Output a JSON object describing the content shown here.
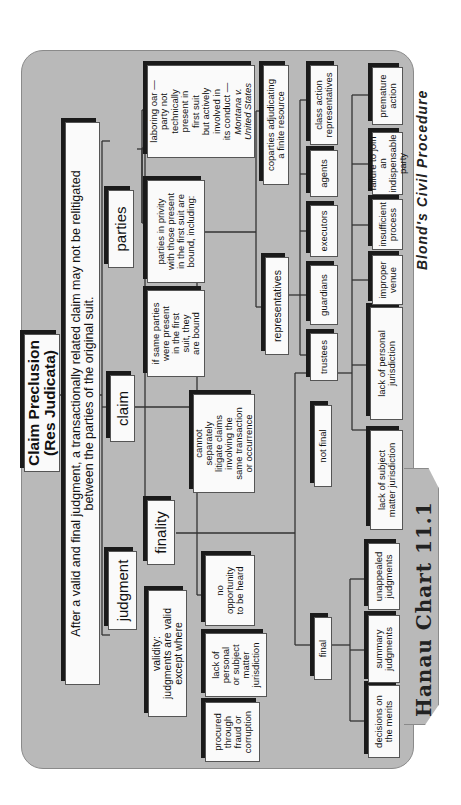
{
  "chart_title": "Claim Preclusion (Res Judicata)",
  "title_lines": "Claim Preclusion\n(Res Judicata)",
  "statement": "After a valid and final judgment, a transactionally related claim may not be relitigated\nbetween the parties of the original suit.",
  "branches": {
    "judgment": {
      "label": "judgment",
      "validity": {
        "label": "validity:\njudgments are valid\nexcept where",
        "exceptions": [
          "procured\nthrough\nfraud or\ncorruption",
          "lack of\npersonal\nor subject\nmatter\njurisdiction",
          "no\nopportunity\nto be heard"
        ]
      },
      "finality": {
        "label": "finality",
        "final": {
          "label": "final",
          "items": [
            "decisions on\nthe merits",
            "summary\njudgments",
            "unappealed\njudgments"
          ]
        },
        "not_final": {
          "label": "not final",
          "items": [
            "lack of subject\nmatter jurisdiction",
            "lack of personal\njurisdiction",
            "improper\nvenue",
            "insufficient\nprocess",
            "failure to join\nan indispensable\nparty",
            "premature\naction"
          ]
        }
      }
    },
    "claim": {
      "label": "claim",
      "description": "cannot\nseparately\nlitigate claims\ninvolving the\nsame transaction\nor occurrence"
    },
    "parties": {
      "label": "parties",
      "same_parties": "if same parties\nwere present\nin the first\nsuit, they\nare bound",
      "privity": {
        "label": "parties in privity\nwith those present\nin the first suit are\nbound, including:",
        "representatives": {
          "label": "representatives",
          "items": [
            "trustees",
            "guardians",
            "executors",
            "agents",
            "class action\nrepresentatives"
          ]
        },
        "coparties": "coparties adjudicating\na finite resource",
        "laboring_oar": "laboring oar —\nparty not\ntechnically\npresent in\nfirst suit\nbut actively\ninvolved in\nits conduct —",
        "laboring_oar_case": "Montana v.\nUnited States"
      }
    }
  },
  "footer": {
    "chart_label": "Hanau Chart 11.1",
    "publisher": "Blond's Civil Procedure"
  },
  "colors": {
    "panel": "#b9b9b9",
    "box": "#fafafa",
    "shadow": "#1a1a1a",
    "text": "#111111"
  }
}
